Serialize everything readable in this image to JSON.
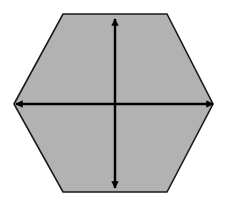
{
  "figure": {
    "canvas": {
      "width": 229,
      "height": 207,
      "background_color": "#ffffff"
    },
    "shape": {
      "name": "hexagon",
      "sides": 6,
      "orientation": "flat-top",
      "fill_color": "#b2b2b2",
      "stroke_color": "#1a1a1a",
      "stroke_width": 1.6,
      "vertices": [
        {
          "label": "left",
          "x": 14,
          "y": 104
        },
        {
          "label": "top-left",
          "x": 63,
          "y": 14
        },
        {
          "label": "top-right",
          "x": 167,
          "y": 14
        },
        {
          "label": "right",
          "x": 213,
          "y": 104
        },
        {
          "label": "bottom-right",
          "x": 167,
          "y": 192
        },
        {
          "label": "bottom-left",
          "x": 63,
          "y": 192
        }
      ],
      "points_attr": "14,104 63,14 167,14 213,104 167,192 63,192"
    },
    "arrows": [
      {
        "name": "vertical-double-arrow",
        "orientation": "vertical",
        "color": "#000000",
        "shaft_width": 2.4,
        "double_headed": true,
        "x1": 115,
        "y1": 19,
        "x2": 115,
        "y2": 188,
        "length": 169
      },
      {
        "name": "horizontal-double-arrow",
        "orientation": "horizontal",
        "color": "#000000",
        "shaft_width": 2.4,
        "double_headed": true,
        "x1": 16,
        "y1": 104,
        "x2": 213,
        "y2": 104,
        "length": 197
      }
    ],
    "intersection": {
      "x": 115,
      "y": 104
    },
    "labels": []
  }
}
